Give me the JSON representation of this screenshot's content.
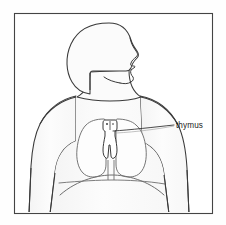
{
  "figure": {
    "background_color": "#fefefe",
    "frame": {
      "name": "illustration-border",
      "stroke_color": "#444444",
      "fill_color": "#ffffff",
      "x": 14,
      "y": 13,
      "width": 198,
      "height": 200
    }
  },
  "labels": [
    {
      "id": "thymus",
      "text": "thymus",
      "color": "#1a1a1a",
      "text_x": 176,
      "text_y": 128,
      "leader_from_x": 113,
      "leader_from_y": 131,
      "leader_to_x": 174,
      "leader_to_y": 125
    }
  ],
  "anatomy": {
    "body_outline": {
      "name": "body-silhouette",
      "stroke_color": "#3a3a3a",
      "fill_color": "#fbfbfb"
    },
    "head": {
      "name": "head-profile",
      "description": "head in right-facing profile with nose, lips and chin",
      "stroke_color": "#3a3a3a",
      "fill_color": "#fbfbfb"
    },
    "lungs": {
      "name": "lungs",
      "description": "left and right lung lobes flanking the mediastinum",
      "stroke_color": "#6e6e6e",
      "fill_color": "#fdfdfd"
    },
    "diaphragm": {
      "name": "diaphragm",
      "description": "arched diaphragm line beneath the lungs",
      "stroke_color": "#6e6e6e"
    },
    "thymus_organ": {
      "name": "thymus-gland",
      "description": "small bilobed gland above the heart between the lungs",
      "stroke_color": "#3a3a3a",
      "fill_color": "#ffffff"
    },
    "arms": {
      "name": "arms",
      "description": "upper arms descending at both sides of the torso",
      "stroke_color": "#3a3a3a"
    }
  }
}
